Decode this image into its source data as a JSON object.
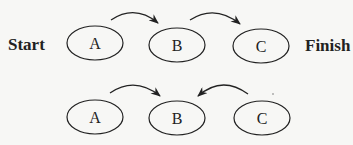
{
  "diagram": {
    "row1": {
      "start_label": "Start",
      "finish_label": "Finish",
      "nodes": [
        "A",
        "B",
        "C"
      ],
      "edges": [
        {
          "from": "A",
          "to": "B"
        },
        {
          "from": "B",
          "to": "C"
        }
      ]
    },
    "row2": {
      "nodes": [
        "A",
        "B",
        "C"
      ],
      "edges": [
        {
          "from": "A",
          "to": "B"
        },
        {
          "from": "C",
          "to": "B"
        }
      ]
    }
  }
}
